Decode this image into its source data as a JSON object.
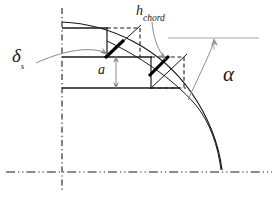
{
  "figure": {
    "background_color": "#ffffff",
    "width": 278,
    "height": 199
  },
  "labels": {
    "delta_s": {
      "symbol": "δ",
      "subscript": "s",
      "name": "delta-s"
    },
    "h_chord": {
      "symbol": "h",
      "subscript": "chord",
      "name": "h-chord"
    },
    "a": {
      "symbol": "a",
      "name": "a"
    },
    "alpha": {
      "symbol": "α",
      "name": "alpha"
    }
  },
  "colors": {
    "line": "#1a1a1a",
    "thick_blade": "#000000",
    "leader": "#8c8c8c",
    "reference_line": "#a8a8a8",
    "background": "#ffffff"
  },
  "geometry": {
    "vertical_centerline": {
      "x": 62,
      "y1": 8,
      "y2": 190,
      "style": "dash-dot"
    },
    "horizontal_centerline": {
      "y": 172,
      "x1": 6,
      "x2": 272,
      "style": "dash-dot-dot"
    },
    "outer_curve": {
      "start": [
        62,
        22
      ],
      "end": [
        222,
        170
      ],
      "style": "solid"
    },
    "inner_curve": {
      "start": [
        107,
        41
      ],
      "end": [
        222,
        170
      ],
      "style": "solid"
    },
    "reference_horizontal": {
      "y": 38,
      "x1": 168,
      "x2": 258,
      "style": "solid-gray"
    },
    "horizontal_rails": [
      {
        "y": 28,
        "x1": 62,
        "x2": 108
      },
      {
        "y": 57,
        "x1": 62,
        "x2": 152
      },
      {
        "y": 88,
        "x1": 62,
        "x2": 180
      }
    ],
    "blade_segments": [
      {
        "from": [
          106,
          57
        ],
        "to": [
          124,
          40
        ],
        "name": "blade-segment-1"
      },
      {
        "from": [
          150,
          75
        ],
        "to": [
          170,
          57
        ],
        "name": "blade-segment-2"
      }
    ],
    "dimension_arrow_a": {
      "x": 116,
      "y1": 57,
      "y2": 88,
      "double_headed": true
    },
    "alpha_arc": {
      "from": [
        184,
        96
      ],
      "to": [
        215,
        40
      ]
    }
  }
}
